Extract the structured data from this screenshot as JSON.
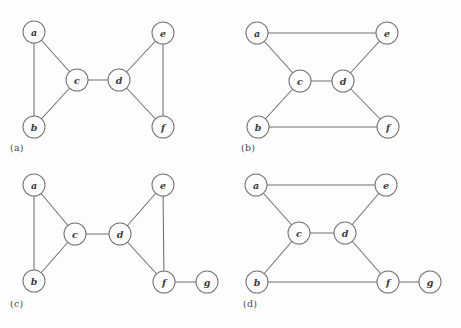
{
  "figure": {
    "background_color": "#fdfdfd",
    "node_stroke_color": "#75757a",
    "edge_color": "#6e6e70",
    "label_color": "#3a3a3c",
    "node_radius": 11
  },
  "panels": [
    {
      "id": "a",
      "caption": "(a)",
      "caption_x": 10,
      "caption_y": 142,
      "origin_x": 0,
      "origin_y": 0,
      "nodes": [
        {
          "id": "a",
          "label": "a",
          "x": 34,
          "y": 32
        },
        {
          "id": "b",
          "label": "b",
          "x": 34,
          "y": 127
        },
        {
          "id": "c",
          "label": "c",
          "x": 77,
          "y": 80
        },
        {
          "id": "d",
          "label": "d",
          "x": 119,
          "y": 80
        },
        {
          "id": "e",
          "label": "e",
          "x": 163,
          "y": 33
        },
        {
          "id": "f",
          "label": "f",
          "x": 163,
          "y": 127
        }
      ],
      "edges": [
        {
          "from": "a",
          "to": "b"
        },
        {
          "from": "a",
          "to": "c"
        },
        {
          "from": "b",
          "to": "c"
        },
        {
          "from": "c",
          "to": "d"
        },
        {
          "from": "d",
          "to": "e"
        },
        {
          "from": "d",
          "to": "f"
        },
        {
          "from": "e",
          "to": "f"
        }
      ]
    },
    {
      "id": "b",
      "caption": "(b)",
      "caption_x": 10,
      "caption_y": 142,
      "origin_x": 231,
      "origin_y": 0,
      "nodes": [
        {
          "id": "a",
          "label": "a",
          "x": 26,
          "y": 33
        },
        {
          "id": "e",
          "label": "e",
          "x": 156,
          "y": 33
        },
        {
          "id": "c",
          "label": "c",
          "x": 69,
          "y": 81
        },
        {
          "id": "d",
          "label": "d",
          "x": 112,
          "y": 81
        },
        {
          "id": "b",
          "label": "b",
          "x": 27,
          "y": 127
        },
        {
          "id": "f",
          "label": "f",
          "x": 157,
          "y": 127
        }
      ],
      "edges": [
        {
          "from": "a",
          "to": "e"
        },
        {
          "from": "a",
          "to": "c"
        },
        {
          "from": "b",
          "to": "c"
        },
        {
          "from": "b",
          "to": "f"
        },
        {
          "from": "c",
          "to": "d"
        },
        {
          "from": "d",
          "to": "e"
        },
        {
          "from": "d",
          "to": "f"
        }
      ]
    },
    {
      "id": "c",
      "caption": "(c)",
      "caption_x": 10,
      "caption_y": 134,
      "origin_x": 0,
      "origin_y": 164,
      "nodes": [
        {
          "id": "a",
          "label": "a",
          "x": 34,
          "y": 21
        },
        {
          "id": "b",
          "label": "b",
          "x": 34,
          "y": 117
        },
        {
          "id": "c",
          "label": "c",
          "x": 75,
          "y": 70
        },
        {
          "id": "d",
          "label": "d",
          "x": 120,
          "y": 70
        },
        {
          "id": "e",
          "label": "e",
          "x": 163,
          "y": 21
        },
        {
          "id": "f",
          "label": "f",
          "x": 164,
          "y": 118
        },
        {
          "id": "g",
          "label": "g",
          "x": 207,
          "y": 118
        }
      ],
      "edges": [
        {
          "from": "a",
          "to": "b"
        },
        {
          "from": "a",
          "to": "c"
        },
        {
          "from": "b",
          "to": "c"
        },
        {
          "from": "c",
          "to": "d"
        },
        {
          "from": "d",
          "to": "e"
        },
        {
          "from": "d",
          "to": "f"
        },
        {
          "from": "e",
          "to": "f"
        },
        {
          "from": "f",
          "to": "g"
        }
      ]
    },
    {
      "id": "d",
      "caption": "(d)",
      "caption_x": 12,
      "caption_y": 134,
      "origin_x": 231,
      "origin_y": 164,
      "nodes": [
        {
          "id": "a",
          "label": "a",
          "x": 25,
          "y": 21
        },
        {
          "id": "e",
          "label": "e",
          "x": 155,
          "y": 21
        },
        {
          "id": "c",
          "label": "c",
          "x": 68,
          "y": 69
        },
        {
          "id": "d",
          "label": "d",
          "x": 114,
          "y": 69
        },
        {
          "id": "b",
          "label": "b",
          "x": 26,
          "y": 118
        },
        {
          "id": "f",
          "label": "f",
          "x": 157,
          "y": 118
        },
        {
          "id": "g",
          "label": "g",
          "x": 199,
          "y": 118
        }
      ],
      "edges": [
        {
          "from": "a",
          "to": "e"
        },
        {
          "from": "a",
          "to": "c"
        },
        {
          "from": "b",
          "to": "c"
        },
        {
          "from": "b",
          "to": "f"
        },
        {
          "from": "c",
          "to": "d"
        },
        {
          "from": "d",
          "to": "e"
        },
        {
          "from": "d",
          "to": "f"
        },
        {
          "from": "f",
          "to": "g"
        }
      ]
    }
  ]
}
